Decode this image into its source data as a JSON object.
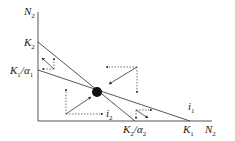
{
  "axes": {
    "y_label": "N",
    "y_label_sub": "2",
    "x_label": "N",
    "x_label_sub": "2"
  },
  "intercepts": {
    "k2": {
      "main": "K",
      "sub": "2"
    },
    "k1_over_alpha1": {
      "main": "K",
      "sub1": "1",
      "mid": "/α",
      "sub2": "1"
    },
    "k2_over_alpha2": {
      "main": "K",
      "sub1": "2",
      "mid": "/α",
      "sub2": "2"
    },
    "k1": {
      "main": "K",
      "sub": "1"
    }
  },
  "isoclines": {
    "i1": {
      "main": "i",
      "sub": "1"
    },
    "i2": {
      "main": "i",
      "sub": "2"
    }
  },
  "colors": {
    "line": "#333333",
    "dot": "#111111"
  }
}
